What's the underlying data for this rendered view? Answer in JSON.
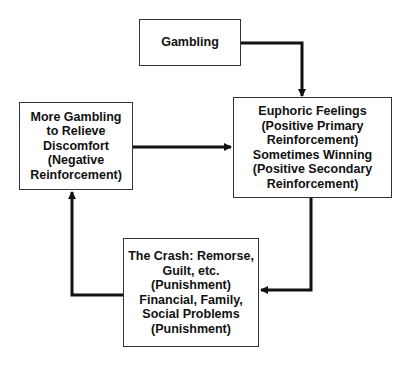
{
  "diagram": {
    "type": "cycle-flowchart",
    "nodes": {
      "gambling": {
        "lines": [
          "Gambling"
        ]
      },
      "euphoric": {
        "lines": [
          "Euphoric Feelings",
          "(Positive Primary",
          "Reinforcement)",
          "Sometimes Winning",
          "(Positive Secondary",
          "Reinforcement)"
        ]
      },
      "crash": {
        "lines": [
          "The Crash: Remorse,",
          "Guilt, etc.",
          "(Punishment)",
          "Financial, Family,",
          "Social Problems",
          "(Punishment)"
        ]
      },
      "more_gambling": {
        "lines": [
          "More Gambling",
          "to Relieve",
          "Discomfort",
          "(Negative",
          "Reinforcement)"
        ]
      }
    },
    "edges": [
      {
        "from": "gambling",
        "to": "euphoric"
      },
      {
        "from": "euphoric",
        "to": "crash"
      },
      {
        "from": "crash",
        "to": "more_gambling"
      },
      {
        "from": "more_gambling",
        "to": "euphoric"
      }
    ],
    "colors": {
      "stroke": "#111111",
      "box_border": "#333333",
      "text": "#111111",
      "background": "#ffffff"
    }
  }
}
